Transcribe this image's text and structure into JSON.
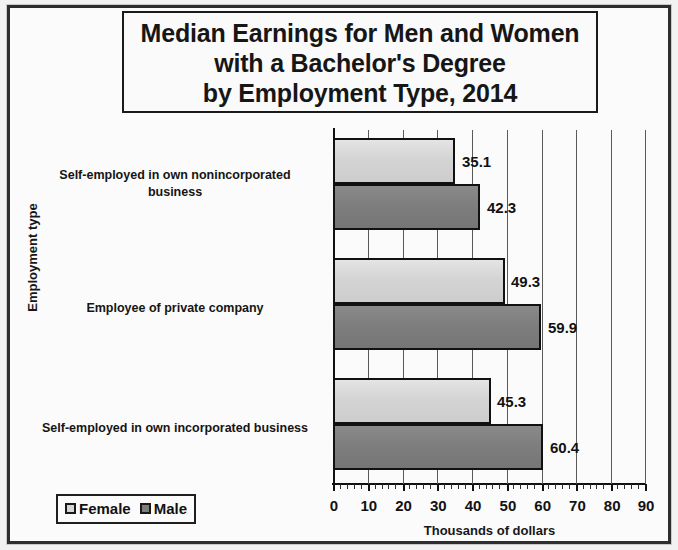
{
  "title_lines": [
    "Median Earnings for Men and Women",
    "with a Bachelor's Degree",
    "by Employment Type, 2014"
  ],
  "axes": {
    "ylabel": "Employment type",
    "xlabel": "Thousands of dollars",
    "xticks": [
      "0",
      "10",
      "20",
      "30",
      "40",
      "50",
      "60",
      "70",
      "80",
      "90"
    ]
  },
  "legend": {
    "items": [
      {
        "label": "Female",
        "swatch": "legend-swatch-female",
        "color": "#d6d6d6"
      },
      {
        "label": "Male",
        "swatch": "legend-swatch-male",
        "color": "#7d7d7d"
      }
    ]
  },
  "categories": [
    {
      "line1": "Self-employed in own nonincorporated",
      "line2": "business"
    },
    {
      "line1": "Employee of private company",
      "line2": ""
    },
    {
      "line1": "Self-employed in own incorporated business",
      "line2": ""
    }
  ],
  "values": {
    "g0_female": "35.1",
    "g0_male": "42.3",
    "g1_female": "49.3",
    "g1_male": "59.9",
    "g2_female": "45.3",
    "g2_male": "60.4"
  },
  "chart_data": {
    "type": "bar",
    "orientation": "horizontal",
    "title": "Median Earnings for Men and Women with a Bachelor's Degree by Employment Type, 2014",
    "xlabel": "Thousands of dollars",
    "ylabel": "Employment type",
    "categories": [
      "Self-employed in own nonincorporated business",
      "Employee of private company",
      "Self-employed in own incorporated business"
    ],
    "series": [
      {
        "name": "Female",
        "values": [
          35.1,
          49.3,
          45.3
        ],
        "color": "#d6d6d6"
      },
      {
        "name": "Male",
        "values": [
          42.3,
          59.9,
          60.4
        ],
        "color": "#7d7d7d"
      }
    ],
    "xlim": [
      0,
      90
    ],
    "xtick_step": 10,
    "xminor_tick_step": 2,
    "grid": true,
    "legend_position": "bottom-left"
  }
}
